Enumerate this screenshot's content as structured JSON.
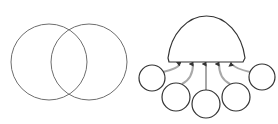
{
  "diagram": {
    "colors": {
      "background": "#ffffff",
      "stroke": "#333333",
      "venn_stroke": "#6e6e6e",
      "arrow": "#a8a8a8",
      "arrow_head": "#333333"
    },
    "venn": {
      "circles": [
        {
          "label": "",
          "cx": 49,
          "cy": 62,
          "r": 38
        },
        {
          "label": "",
          "cx": 89,
          "cy": 62,
          "r": 38
        }
      ]
    },
    "hub": {
      "label": "",
      "shape": "dome",
      "cx": 206,
      "base_y": 62,
      "r": 39
    },
    "nodes": [
      {
        "label": "",
        "cx": 152,
        "cy": 78,
        "r": 13
      },
      {
        "label": "",
        "cx": 176,
        "cy": 97,
        "r": 14
      },
      {
        "label": "",
        "cx": 206,
        "cy": 104,
        "r": 14
      },
      {
        "label": "",
        "cx": 236,
        "cy": 97,
        "r": 14
      },
      {
        "label": "",
        "cx": 262,
        "cy": 77,
        "r": 13
      }
    ],
    "arrows": [
      {
        "from": 0,
        "tip_x": 180
      },
      {
        "from": 1,
        "tip_x": 193
      },
      {
        "from": 2,
        "tip_x": 206
      },
      {
        "from": 3,
        "tip_x": 219
      },
      {
        "from": 4,
        "tip_x": 232
      }
    ]
  }
}
